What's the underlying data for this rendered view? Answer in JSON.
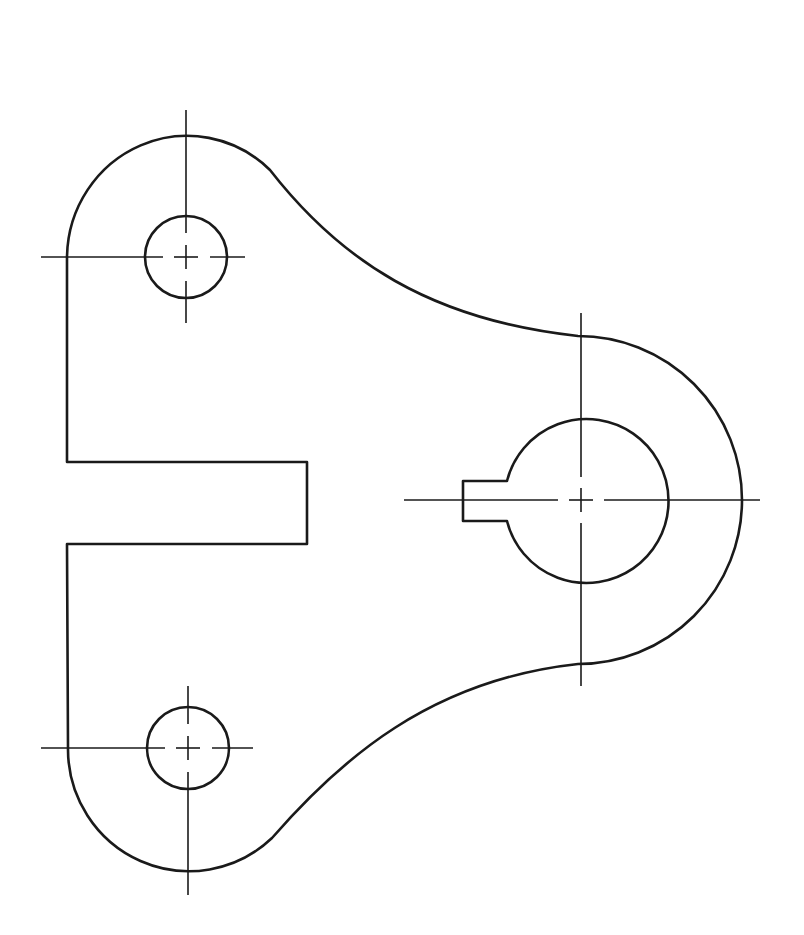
{
  "drawing": {
    "title": "Lever bracket - technical drawing (plan view)",
    "colors": {
      "line": "#1a1a1a",
      "background": "#ffffff"
    },
    "features": {
      "outer_outline": {
        "left_edge_x": 67,
        "top_boss_center": [
          186,
          257
        ],
        "bottom_boss_center": [
          188,
          748
        ],
        "boss_radius": 120
      },
      "slot": {
        "x1": 67,
        "x2": 307,
        "y1": 462,
        "y2": 544
      },
      "top_hole": {
        "cx": 186,
        "cy": 257,
        "r": 41
      },
      "bottom_hole": {
        "cx": 188,
        "cy": 748,
        "r": 41
      },
      "hub": {
        "cx": 581,
        "cy": 500,
        "r_outer": 163,
        "r_bore": 82
      },
      "keyway": {
        "x_left": 463,
        "y_top": 481,
        "y_bottom": 521
      }
    },
    "icons": [
      "centerline-cross-icon"
    ]
  }
}
